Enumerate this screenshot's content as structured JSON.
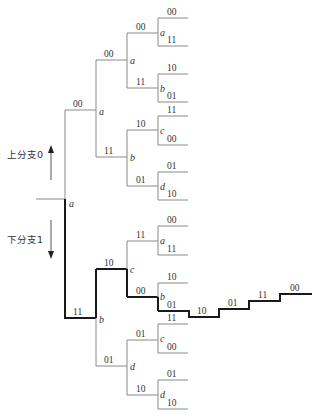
{
  "diagram": {
    "type": "code-tree",
    "annotations": {
      "upper_branch": "上分支0",
      "lower_branch": "下分支1"
    },
    "root": {
      "state": "a"
    },
    "upper": {
      "level1": {
        "label": "00",
        "state": "a"
      },
      "level2": [
        {
          "label": "00",
          "state": "a",
          "leaves": [
            {
              "label": "00",
              "state": "a",
              "outs": [
                "00",
                "11"
              ]
            },
            {
              "label": "11",
              "state": "b",
              "outs": [
                "10",
                "01"
              ]
            }
          ]
        },
        {
          "label": "11",
          "state": "b",
          "leaves": [
            {
              "label": "10",
              "state": "c",
              "outs": [
                "11",
                "00"
              ]
            },
            {
              "label": "01",
              "state": "d",
              "outs": [
                "01",
                "10"
              ]
            }
          ]
        }
      ]
    },
    "lower": {
      "level1": {
        "label": "11",
        "state": "b"
      },
      "level2": [
        {
          "label": "10",
          "state": "c",
          "leaves": [
            {
              "label": "11",
              "state": "a",
              "outs": [
                "00",
                "11"
              ]
            },
            {
              "label": "00",
              "state": "b",
              "outs": [
                "10",
                "01"
              ]
            }
          ]
        },
        {
          "label": "01",
          "state": "d",
          "leaves": [
            {
              "label": "01",
              "state": "c",
              "outs": [
                "11",
                "00"
              ]
            },
            {
              "label": "10",
              "state": "d",
              "outs": [
                "01",
                "10"
              ]
            }
          ]
        }
      ]
    },
    "highlighted_path": [
      "11",
      "10",
      "00",
      "01",
      "10",
      "01",
      "11",
      "00"
    ],
    "extension_labels": [
      "10",
      "01",
      "11",
      "00"
    ]
  }
}
